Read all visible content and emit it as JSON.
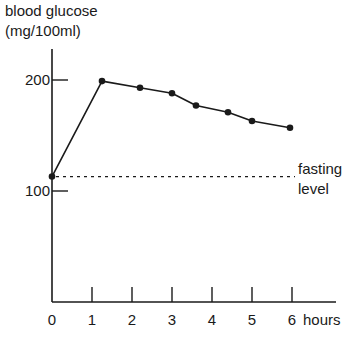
{
  "chart_data": {
    "type": "line",
    "title": "",
    "ylabel_line1": "blood glucose",
    "ylabel_line2": "(mg/100ml)",
    "xlabel": "hours",
    "x": [
      0,
      1.25,
      2.2,
      3,
      3.6,
      4.4,
      5,
      5.95
    ],
    "series": [
      {
        "name": "blood glucose",
        "values": [
          113,
          199,
          193,
          188,
          177,
          171,
          163,
          157
        ]
      }
    ],
    "xticks": [
      "0",
      "1",
      "2",
      "3",
      "4",
      "5",
      "6"
    ],
    "yticks": [
      "100",
      "200"
    ],
    "xlim": [
      0,
      7
    ],
    "ylim": [
      27,
      240
    ],
    "grid": false,
    "reference_line": {
      "label_line1": "fasting",
      "label_line2": "level",
      "value": 113,
      "style": "dotted"
    },
    "colors": {
      "line": "#1a1a1a",
      "axis": "#1a1a1a"
    }
  }
}
